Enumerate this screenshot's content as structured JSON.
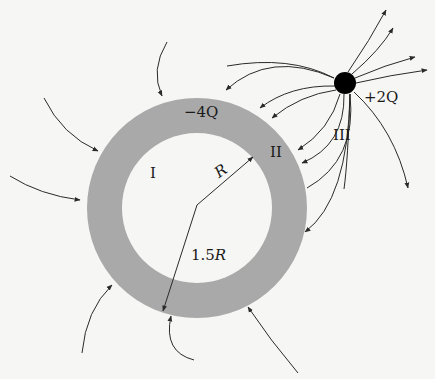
{
  "diagram": {
    "type": "electric field lines around charged conducting shell and point charge",
    "colors": {
      "background": "#f6f6f4",
      "shell": "#a9a9a9",
      "inner_region": "#f6f6f4",
      "lines": "#2a2a2a",
      "point_charge": "#000000"
    },
    "shell": {
      "charge_label": "−4Q",
      "inner_radius_label": "R",
      "outer_radius_label_num": "1.5",
      "outer_radius_label_var": "R",
      "center": [
        197,
        208
      ],
      "outer_radius_px": 110,
      "inner_radius_px": 75
    },
    "point_charge": {
      "label": "+2Q",
      "center": [
        345,
        83
      ],
      "radius_px": 11
    },
    "regions": {
      "region_1": "I",
      "region_2": "II",
      "region_3": "III"
    }
  }
}
